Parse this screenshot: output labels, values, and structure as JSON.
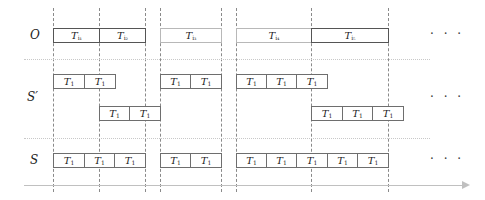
{
  "diagram": {
    "rows": {
      "O": {
        "label": "O"
      },
      "S_prime": {
        "label": "S′"
      },
      "S": {
        "label": "S"
      }
    },
    "ellipsis": "· · ·",
    "vertical_dashed_lines_x": [
      53,
      99,
      145,
      160,
      221,
      236,
      311,
      388
    ],
    "O_boxes": [
      {
        "label": "T",
        "sub": "i₁",
        "x": 53,
        "w": 46,
        "style": "dark"
      },
      {
        "label": "T",
        "sub": "i₂",
        "x": 99,
        "w": 46,
        "style": "dark"
      },
      {
        "label": "T",
        "sub": "i₃",
        "x": 160,
        "w": 61,
        "style": "light"
      },
      {
        "label": "T",
        "sub": "i₄",
        "x": 236,
        "w": 75,
        "style": "light"
      },
      {
        "label": "T",
        "sub": "i₅",
        "x": 311,
        "w": 77,
        "style": "dark"
      }
    ],
    "S_prime_top_boxes": [
      {
        "label": "T",
        "sub": "1",
        "x": 53,
        "w": 31
      },
      {
        "label": "T",
        "sub": "1",
        "x": 84,
        "w": 31
      },
      {
        "label": "T",
        "sub": "1",
        "x": 160,
        "w": 30
      },
      {
        "label": "T",
        "sub": "1",
        "x": 190,
        "w": 31
      },
      {
        "label": "T",
        "sub": "1",
        "x": 236,
        "w": 30
      },
      {
        "label": "T",
        "sub": "1",
        "x": 266,
        "w": 30
      },
      {
        "label": "T",
        "sub": "1",
        "x": 296,
        "w": 31
      }
    ],
    "S_prime_bottom_boxes": [
      {
        "label": "T",
        "sub": "1",
        "x": 99,
        "w": 30
      },
      {
        "label": "T",
        "sub": "1",
        "x": 129,
        "w": 31
      },
      {
        "label": "T",
        "sub": "1",
        "x": 311,
        "w": 31
      },
      {
        "label": "T",
        "sub": "1",
        "x": 342,
        "w": 30
      },
      {
        "label": "T",
        "sub": "1",
        "x": 372,
        "w": 31
      }
    ],
    "S_boxes": [
      {
        "label": "T",
        "sub": "1",
        "x": 53,
        "w": 31
      },
      {
        "label": "T",
        "sub": "1",
        "x": 84,
        "w": 30
      },
      {
        "label": "T",
        "sub": "1",
        "x": 114,
        "w": 31
      },
      {
        "label": "T",
        "sub": "1",
        "x": 160,
        "w": 30
      },
      {
        "label": "T",
        "sub": "1",
        "x": 190,
        "w": 31
      },
      {
        "label": "T",
        "sub": "1",
        "x": 236,
        "w": 30
      },
      {
        "label": "T",
        "sub": "1",
        "x": 266,
        "w": 30
      },
      {
        "label": "T",
        "sub": "1",
        "x": 296,
        "w": 31
      },
      {
        "label": "T",
        "sub": "1",
        "x": 327,
        "w": 30
      },
      {
        "label": "T",
        "sub": "1",
        "x": 357,
        "w": 31
      }
    ],
    "time_axis": {
      "arrow": "right"
    }
  }
}
